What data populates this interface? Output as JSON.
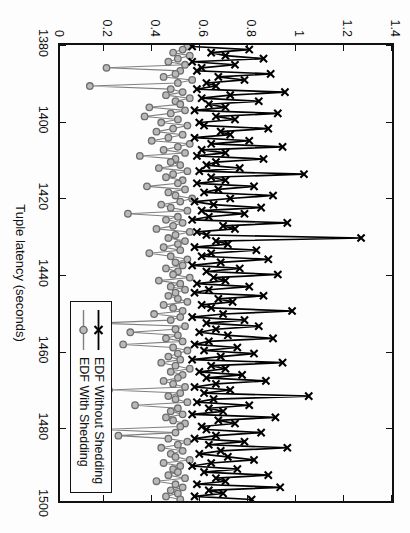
{
  "figure": {
    "rotation_degrees": 90,
    "background": "#fdfdfd"
  },
  "axes": {
    "x_title": "Tuple latency (seconds)",
    "x_ticks": [
      "1380",
      "1400",
      "1420",
      "1440",
      "1460",
      "1480",
      "1500"
    ],
    "y_ticks": [
      "0",
      "0.2",
      "0.4",
      "0.6",
      "0.8",
      "1",
      "1.2",
      "1.4"
    ],
    "frame_color": "#111111"
  },
  "legend": {
    "position": "bottom-right",
    "items": [
      {
        "label": "EDF Without Shedding",
        "marker": "cross-x",
        "color": "#000000"
      },
      {
        "label": "EDF With Shedding",
        "marker": "circle",
        "color": "#808080"
      }
    ]
  },
  "chart_data": {
    "type": "line",
    "title": "",
    "xlabel": "Tuple latency (seconds)",
    "ylabel": "",
    "xlim": [
      1380,
      1500
    ],
    "ylim": [
      0,
      1.4
    ],
    "xticks": [
      1380,
      1400,
      1420,
      1440,
      1460,
      1480,
      1500
    ],
    "yticks": [
      0,
      0.2,
      0.4,
      0.6,
      0.8,
      1,
      1.2,
      1.4
    ],
    "grid": false,
    "legend_position": "lower right",
    "series": [
      {
        "name": "EDF Without Shedding",
        "marker": "x",
        "color": "#000000",
        "x": [
          1380.4,
          1381.2,
          1382.0,
          1382.8,
          1383.6,
          1384.4,
          1385.2,
          1386.0,
          1386.8,
          1387.6,
          1388.4,
          1389.2,
          1390.0,
          1390.8,
          1391.6,
          1392.4,
          1393.2,
          1394.0,
          1394.8,
          1395.6,
          1396.4,
          1397.2,
          1398.0,
          1398.8,
          1399.6,
          1400.4,
          1401.2,
          1402.0,
          1402.8,
          1403.6,
          1404.4,
          1405.2,
          1406.0,
          1406.8,
          1407.6,
          1408.4,
          1409.2,
          1410.0,
          1410.8,
          1411.6,
          1412.4,
          1413.2,
          1414.0,
          1414.8,
          1415.6,
          1416.4,
          1417.2,
          1418.0,
          1418.8,
          1419.6,
          1420.4,
          1421.2,
          1422.0,
          1422.8,
          1423.6,
          1424.4,
          1425.2,
          1426.0,
          1426.8,
          1427.6,
          1428.4,
          1429.2,
          1430.0,
          1430.8,
          1431.6,
          1432.4,
          1433.2,
          1434.0,
          1434.8,
          1435.6,
          1436.4,
          1437.2,
          1438.0,
          1438.8,
          1439.6,
          1440.4,
          1441.2,
          1442.0,
          1442.8,
          1443.6,
          1444.4,
          1445.2,
          1446.0,
          1446.8,
          1447.6,
          1448.4,
          1449.2,
          1450.0,
          1450.8,
          1451.6,
          1452.4,
          1453.2,
          1454.0,
          1454.8,
          1455.6,
          1456.4,
          1457.2,
          1458.0,
          1458.8,
          1459.6,
          1460.4,
          1461.2,
          1462.0,
          1462.8,
          1463.6,
          1464.4,
          1465.2,
          1466.0,
          1466.8,
          1467.6,
          1468.4,
          1469.2,
          1470.0,
          1470.8,
          1471.6,
          1472.4,
          1473.2,
          1474.0,
          1474.8,
          1475.6,
          1476.4,
          1477.2,
          1478.0,
          1478.8,
          1479.6,
          1480.4,
          1481.2,
          1482.0,
          1482.8,
          1483.6,
          1484.4,
          1485.2,
          1486.0,
          1486.8,
          1487.6,
          1488.4,
          1489.2,
          1490.0,
          1490.8,
          1491.6,
          1492.4,
          1493.2,
          1494.0,
          1494.8,
          1495.6,
          1496.4,
          1497.2,
          1498.0,
          1498.8,
          1499.6
        ],
        "y": [
          0.56,
          0.8,
          0.64,
          0.7,
          0.86,
          0.56,
          0.74,
          0.6,
          0.58,
          0.89,
          0.67,
          0.78,
          0.62,
          0.66,
          0.58,
          0.95,
          0.72,
          0.6,
          0.84,
          0.63,
          0.7,
          0.57,
          0.92,
          0.66,
          0.74,
          0.59,
          0.61,
          0.88,
          0.68,
          0.72,
          0.57,
          0.8,
          0.64,
          0.94,
          0.6,
          0.7,
          0.58,
          0.86,
          0.66,
          0.62,
          0.76,
          0.59,
          1.03,
          0.64,
          0.7,
          0.58,
          0.82,
          0.67,
          0.61,
          0.9,
          0.72,
          0.57,
          0.65,
          0.85,
          0.6,
          0.78,
          0.63,
          0.56,
          0.96,
          0.69,
          0.74,
          0.58,
          0.62,
          1.27,
          0.66,
          0.71,
          0.57,
          0.83,
          0.64,
          0.6,
          0.88,
          0.68,
          0.56,
          0.76,
          0.62,
          0.92,
          0.65,
          0.7,
          0.58,
          0.8,
          0.63,
          0.57,
          0.86,
          0.67,
          0.73,
          0.6,
          0.64,
          0.98,
          0.69,
          0.56,
          0.78,
          0.62,
          0.84,
          0.66,
          0.59,
          0.71,
          0.9,
          0.63,
          0.57,
          0.75,
          0.61,
          0.82,
          0.68,
          0.56,
          0.94,
          0.64,
          0.7,
          0.59,
          0.77,
          0.62,
          0.87,
          0.66,
          0.57,
          0.72,
          0.61,
          1.05,
          0.65,
          0.58,
          0.8,
          0.63,
          0.69,
          0.56,
          0.91,
          0.67,
          0.74,
          0.6,
          0.62,
          0.85,
          0.66,
          0.57,
          0.78,
          0.63,
          0.96,
          0.68,
          0.59,
          0.71,
          0.82,
          0.64,
          0.56,
          0.75,
          0.61,
          0.88,
          0.66,
          0.7,
          0.58,
          0.93,
          0.63,
          0.69,
          0.57,
          0.81
        ]
      },
      {
        "name": "EDF With Shedding",
        "marker": "o",
        "color": "#808080",
        "x": [
          1380.4,
          1381.2,
          1382.0,
          1382.8,
          1383.6,
          1384.4,
          1385.2,
          1386.0,
          1386.8,
          1387.6,
          1388.4,
          1389.2,
          1390.0,
          1390.8,
          1391.6,
          1392.4,
          1393.2,
          1394.0,
          1394.8,
          1395.6,
          1396.4,
          1397.2,
          1398.0,
          1398.8,
          1399.6,
          1400.4,
          1401.2,
          1402.0,
          1402.8,
          1403.6,
          1404.4,
          1405.2,
          1406.0,
          1406.8,
          1407.6,
          1408.4,
          1409.2,
          1410.0,
          1410.8,
          1411.6,
          1412.4,
          1413.2,
          1414.0,
          1414.8,
          1415.6,
          1416.4,
          1417.2,
          1418.0,
          1418.8,
          1419.6,
          1420.4,
          1421.2,
          1422.0,
          1422.8,
          1423.6,
          1424.4,
          1425.2,
          1426.0,
          1426.8,
          1427.6,
          1428.4,
          1429.2,
          1430.0,
          1430.8,
          1431.6,
          1432.4,
          1433.2,
          1434.0,
          1434.8,
          1435.6,
          1436.4,
          1437.2,
          1438.0,
          1438.8,
          1439.6,
          1440.4,
          1441.2,
          1442.0,
          1442.8,
          1443.6,
          1444.4,
          1445.2,
          1446.0,
          1446.8,
          1447.6,
          1448.4,
          1449.2,
          1450.0,
          1450.8,
          1451.6,
          1452.4,
          1453.2,
          1454.0,
          1454.8,
          1455.6,
          1456.4,
          1457.2,
          1458.0,
          1458.8,
          1459.6,
          1460.4,
          1461.2,
          1462.0,
          1462.8,
          1463.6,
          1464.4,
          1465.2,
          1466.0,
          1466.8,
          1467.6,
          1468.4,
          1469.2,
          1470.0,
          1470.8,
          1471.6,
          1472.4,
          1473.2,
          1474.0,
          1474.8,
          1475.6,
          1476.4,
          1477.2,
          1478.0,
          1478.8,
          1479.6,
          1480.4,
          1481.2,
          1482.0,
          1482.8,
          1483.6,
          1484.4,
          1485.2,
          1486.0,
          1486.8,
          1487.6,
          1488.4,
          1489.2,
          1490.0,
          1490.8,
          1491.6,
          1492.4,
          1493.2,
          1494.0,
          1494.8,
          1495.6,
          1496.4,
          1497.2,
          1498.0,
          1498.8,
          1499.6
        ],
        "y": [
          0.54,
          0.52,
          0.48,
          0.55,
          0.5,
          0.46,
          0.53,
          0.2,
          0.51,
          0.49,
          0.44,
          0.56,
          0.5,
          0.13,
          0.47,
          0.52,
          0.45,
          0.55,
          0.49,
          0.51,
          0.38,
          0.53,
          0.47,
          0.36,
          0.5,
          0.43,
          0.54,
          0.48,
          0.41,
          0.52,
          0.46,
          0.39,
          0.55,
          0.5,
          0.44,
          0.53,
          0.34,
          0.49,
          0.47,
          0.51,
          0.42,
          0.54,
          0.48,
          0.45,
          0.52,
          0.5,
          0.37,
          0.53,
          0.46,
          0.49,
          0.56,
          0.51,
          0.43,
          0.47,
          0.54,
          0.29,
          0.5,
          0.45,
          0.52,
          0.48,
          0.41,
          0.55,
          0.49,
          0.46,
          0.53,
          0.5,
          0.44,
          0.51,
          0.38,
          0.47,
          0.54,
          0.49,
          0.52,
          0.45,
          0.5,
          0.48,
          0.55,
          0.42,
          0.51,
          0.47,
          0.53,
          0.49,
          0.46,
          0.5,
          0.54,
          0.44,
          0.48,
          0.52,
          0.4,
          0.51,
          0.47,
          0.16,
          0.53,
          0.49,
          0.3,
          0.5,
          0.45,
          0.52,
          0.27,
          0.48,
          0.54,
          0.5,
          0.46,
          0.51,
          0.43,
          0.49,
          0.55,
          0.47,
          0.52,
          0.5,
          0.44,
          0.48,
          0.53,
          0.21,
          0.51,
          0.46,
          0.49,
          0.54,
          0.32,
          0.5,
          0.47,
          0.52,
          0.45,
          0.48,
          0.53,
          0.51,
          0.18,
          0.49,
          0.25,
          0.46,
          0.54,
          0.5,
          0.43,
          0.52,
          0.47,
          0.49,
          0.55,
          0.44,
          0.51,
          0.48,
          0.5,
          0.46,
          0.53,
          0.41,
          0.49,
          0.52,
          0.47,
          0.5,
          0.45,
          0.51
        ]
      }
    ]
  }
}
